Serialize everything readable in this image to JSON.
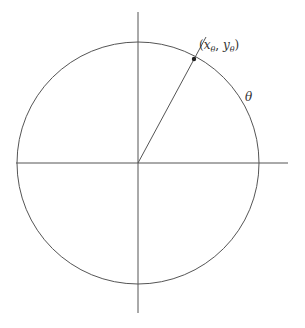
{
  "diagram": {
    "center": {
      "x": 138,
      "y": 163
    },
    "radius": 121,
    "axes": {
      "horizontal": {
        "x1": 16,
        "x2": 288,
        "y": 163
      },
      "vertical": {
        "x": 138,
        "y1": 12,
        "y2": 313
      }
    },
    "point": {
      "x": 194,
      "y": 59,
      "label": "(xθ, yθ)",
      "label_parts": {
        "open": "(",
        "x": "x",
        "x_sub": "θ",
        "sep": ", ",
        "y": "y",
        "y_sub": "θ",
        "close": ")"
      }
    },
    "ray_end": {
      "x": 206,
      "y": 37
    },
    "angle_label": "θ",
    "colors": {
      "stroke": "#444444",
      "point": "#222222",
      "text": "#333333"
    }
  }
}
